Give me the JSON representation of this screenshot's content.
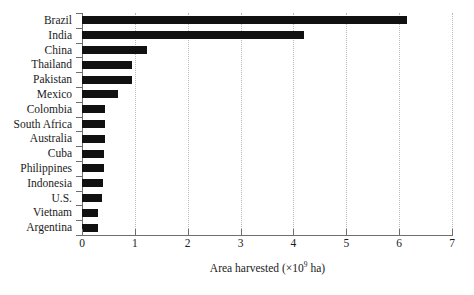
{
  "chart_data": {
    "type": "bar",
    "orientation": "horizontal",
    "title": "",
    "xlabel_parts": {
      "prefix": "Area harvested (×10",
      "exponent": "9",
      "suffix": " ha)"
    },
    "xlabel": "Area harvested (×10⁹ ha)",
    "ylabel": "",
    "xlim": [
      0,
      7
    ],
    "xticks": [
      "0",
      "1",
      "2",
      "3",
      "4",
      "5",
      "6",
      "7"
    ],
    "grid": "vertical-dotted",
    "legend": "none",
    "bar_color": "#111111",
    "categories": [
      "Brazil",
      "India",
      "China",
      "Thailand",
      "Pakistan",
      "Mexico",
      "Colombia",
      "South Africa",
      "Australia",
      "Cuba",
      "Philippines",
      "Indonesia",
      "U.S.",
      "Vietnam",
      "Argentina"
    ],
    "values": [
      6.15,
      4.2,
      1.23,
      0.95,
      0.94,
      0.68,
      0.44,
      0.44,
      0.43,
      0.42,
      0.42,
      0.4,
      0.38,
      0.3,
      0.3
    ]
  }
}
